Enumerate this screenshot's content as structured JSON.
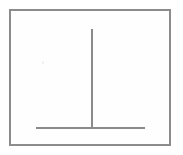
{
  "figure": {
    "background_color": "#ffffff",
    "panel_fill_color": "#fefefe",
    "border_color": "#8c8c8c",
    "stroke_color": "#8a8a8a",
    "canvas": {
      "width": 183,
      "height": 155
    },
    "frame": {
      "name": "outer-border",
      "left": 9,
      "top": 9,
      "width": 162,
      "height": 137,
      "border_width": 2
    },
    "strokes": [
      {
        "name": "vertical-stroke",
        "orientation": "vertical",
        "x": 92,
        "y_start": 29,
        "y_end": 129,
        "length": 100,
        "thickness": 2.5
      },
      {
        "name": "horizontal-stroke",
        "orientation": "horizontal",
        "y": 128,
        "x_start": 36,
        "x_end": 145,
        "length": 109,
        "thickness": 2.5
      }
    ],
    "junction": {
      "name": "t-junction",
      "x": 92,
      "y": 128,
      "type": "inverted-T"
    },
    "labels": [],
    "text_content": ""
  }
}
